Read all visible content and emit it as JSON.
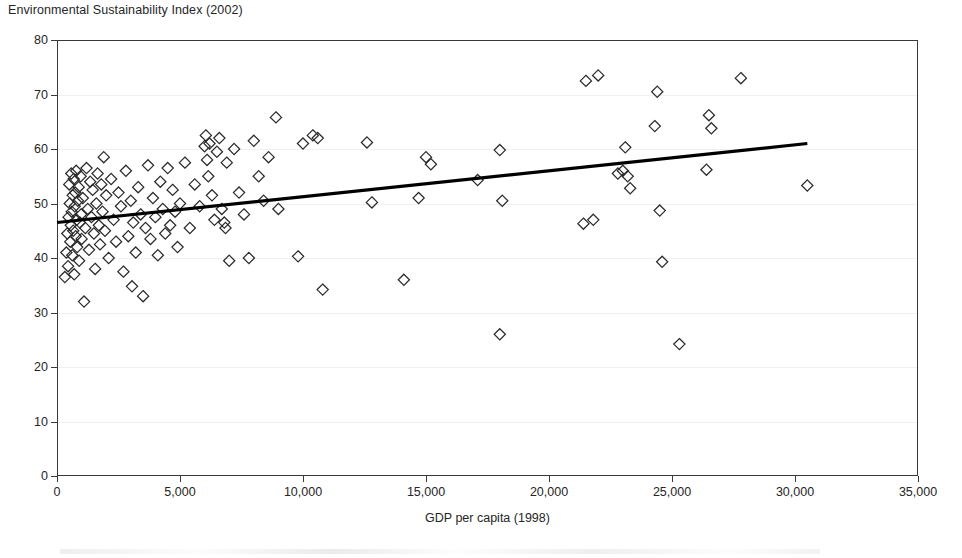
{
  "chart_data": {
    "type": "scatter",
    "title": "Environmental Sustainability Index (2002)",
    "xlabel": "GDP per capita (1998)",
    "ylabel": "",
    "xlim": [
      0,
      35000
    ],
    "ylim": [
      0,
      80
    ],
    "xticks": [
      0,
      5000,
      10000,
      15000,
      20000,
      25000,
      30000,
      35000
    ],
    "xticklabels": [
      "0",
      "5,000",
      "10,000",
      "15,000",
      "20,000",
      "25,000",
      "30,000",
      "35,000"
    ],
    "yticks": [
      0,
      10,
      20,
      30,
      40,
      50,
      60,
      70,
      80
    ],
    "yticklabels": [
      "0",
      "10",
      "20",
      "30",
      "40",
      "50",
      "60",
      "70",
      "80"
    ],
    "grid": "horizontal-faint",
    "legend": null,
    "marker_style": "open-diamond",
    "marker_color": "#2b2b2b",
    "series": [
      {
        "name": "Countries",
        "points": [
          [
            320,
            36.5
          ],
          [
            380,
            41.0
          ],
          [
            420,
            44.5
          ],
          [
            450,
            38.5
          ],
          [
            470,
            47.5
          ],
          [
            500,
            53.5
          ],
          [
            520,
            50.0
          ],
          [
            540,
            43.0
          ],
          [
            560,
            46.0
          ],
          [
            580,
            55.5
          ],
          [
            600,
            48.5
          ],
          [
            620,
            40.5
          ],
          [
            640,
            51.5
          ],
          [
            660,
            45.0
          ],
          [
            680,
            54.5
          ],
          [
            700,
            37.0
          ],
          [
            720,
            49.5
          ],
          [
            740,
            52.0
          ],
          [
            760,
            44.0
          ],
          [
            780,
            56.0
          ],
          [
            800,
            47.0
          ],
          [
            820,
            42.0
          ],
          [
            850,
            50.5
          ],
          [
            880,
            53.0
          ],
          [
            900,
            39.5
          ],
          [
            930,
            46.5
          ],
          [
            960,
            55.0
          ],
          [
            980,
            48.0
          ],
          [
            1000,
            43.5
          ],
          [
            1050,
            51.0
          ],
          [
            1100,
            32.0
          ],
          [
            1150,
            45.5
          ],
          [
            1200,
            56.5
          ],
          [
            1250,
            49.0
          ],
          [
            1300,
            41.5
          ],
          [
            1350,
            54.0
          ],
          [
            1400,
            47.5
          ],
          [
            1450,
            52.5
          ],
          [
            1500,
            44.5
          ],
          [
            1550,
            38.0
          ],
          [
            1600,
            50.0
          ],
          [
            1650,
            55.5
          ],
          [
            1700,
            46.0
          ],
          [
            1750,
            42.5
          ],
          [
            1800,
            53.5
          ],
          [
            1850,
            48.5
          ],
          [
            1900,
            58.5
          ],
          [
            1950,
            45.0
          ],
          [
            2000,
            51.5
          ],
          [
            2100,
            40.0
          ],
          [
            2200,
            54.5
          ],
          [
            2300,
            47.0
          ],
          [
            2400,
            43.0
          ],
          [
            2500,
            52.0
          ],
          [
            2600,
            49.5
          ],
          [
            2700,
            37.5
          ],
          [
            2800,
            56.0
          ],
          [
            2900,
            44.0
          ],
          [
            3000,
            50.5
          ],
          [
            3050,
            34.8
          ],
          [
            3100,
            46.5
          ],
          [
            3200,
            41.0
          ],
          [
            3300,
            53.0
          ],
          [
            3400,
            48.0
          ],
          [
            3500,
            33.0
          ],
          [
            3600,
            45.5
          ],
          [
            3700,
            57.0
          ],
          [
            3800,
            43.5
          ],
          [
            3900,
            51.0
          ],
          [
            4000,
            47.5
          ],
          [
            4100,
            40.5
          ],
          [
            4200,
            54.0
          ],
          [
            4300,
            49.0
          ],
          [
            4400,
            44.5
          ],
          [
            4500,
            56.5
          ],
          [
            4600,
            46.0
          ],
          [
            4700,
            52.5
          ],
          [
            4800,
            48.5
          ],
          [
            4900,
            42.0
          ],
          [
            5000,
            50.0
          ],
          [
            5200,
            57.5
          ],
          [
            5400,
            45.5
          ],
          [
            5600,
            53.5
          ],
          [
            5800,
            49.5
          ],
          [
            6000,
            60.5
          ],
          [
            6050,
            62.5
          ],
          [
            6100,
            58.0
          ],
          [
            6150,
            55.0
          ],
          [
            6200,
            61.0
          ],
          [
            6300,
            51.5
          ],
          [
            6400,
            47.0
          ],
          [
            6500,
            59.5
          ],
          [
            6600,
            62.0
          ],
          [
            6700,
            49.0
          ],
          [
            6800,
            46.5
          ],
          [
            6850,
            45.5
          ],
          [
            6900,
            57.5
          ],
          [
            7000,
            39.5
          ],
          [
            7200,
            60.0
          ],
          [
            7400,
            52.0
          ],
          [
            7600,
            48.0
          ],
          [
            7800,
            40.0
          ],
          [
            8000,
            61.5
          ],
          [
            8200,
            55.0
          ],
          [
            8400,
            50.5
          ],
          [
            8600,
            58.5
          ],
          [
            8900,
            65.8
          ],
          [
            9000,
            49.0
          ],
          [
            9800,
            40.3
          ],
          [
            10000,
            61.0
          ],
          [
            10400,
            62.5
          ],
          [
            10600,
            62.0
          ],
          [
            10800,
            34.2
          ],
          [
            12600,
            61.2
          ],
          [
            12800,
            50.2
          ],
          [
            14100,
            36.0
          ],
          [
            14700,
            51.0
          ],
          [
            15000,
            58.5
          ],
          [
            15200,
            57.2
          ],
          [
            17100,
            54.3
          ],
          [
            18000,
            59.8
          ],
          [
            18100,
            50.5
          ],
          [
            18000,
            26.0
          ],
          [
            21400,
            46.3
          ],
          [
            21500,
            72.5
          ],
          [
            21800,
            47.0
          ],
          [
            22000,
            73.5
          ],
          [
            22800,
            55.5
          ],
          [
            23000,
            56.0
          ],
          [
            23100,
            60.3
          ],
          [
            23200,
            55.0
          ],
          [
            23300,
            52.8
          ],
          [
            24300,
            64.2
          ],
          [
            24400,
            70.5
          ],
          [
            24500,
            48.7
          ],
          [
            24600,
            39.3
          ],
          [
            25300,
            24.2
          ],
          [
            26400,
            56.2
          ],
          [
            26500,
            66.2
          ],
          [
            26600,
            63.8
          ],
          [
            27800,
            73.0
          ],
          [
            30500,
            53.3
          ]
        ]
      }
    ],
    "trendline": {
      "type": "linear",
      "x_start": 0,
      "y_start": 46.5,
      "x_end": 30500,
      "y_end": 61.0,
      "color": "#000000"
    }
  }
}
